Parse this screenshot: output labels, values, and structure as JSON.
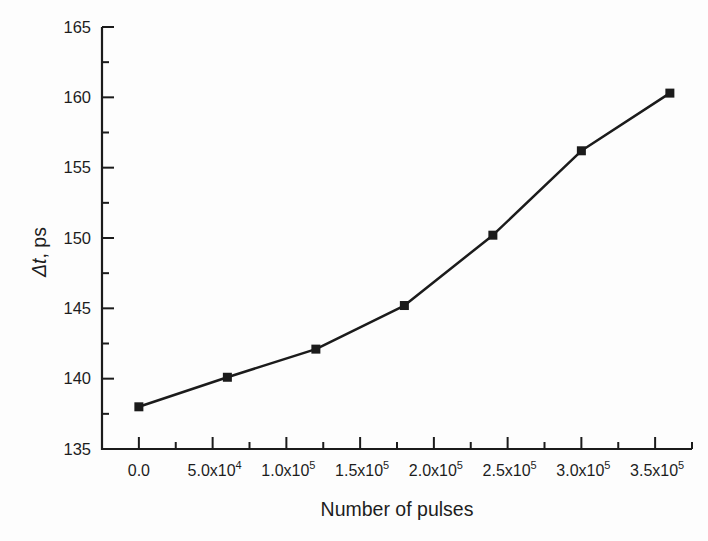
{
  "figure": {
    "background": "#fdfdfd",
    "ink_color": "#1b1b1b"
  },
  "chart_data": {
    "type": "line",
    "title": "",
    "xlabel": "Number of pulses",
    "ylabel": "Δt, ps",
    "ylabel_parts": {
      "italic": "Δt",
      "rest": ", ps"
    },
    "series": [
      {
        "name": "delta-t-vs-pulses",
        "marker": "filled-square",
        "x": [
          0,
          60000,
          120000,
          180000,
          240000,
          300000,
          360000
        ],
        "y": [
          138.0,
          140.1,
          142.1,
          145.2,
          150.2,
          156.2,
          160.3
        ]
      }
    ],
    "xlim": [
      -25000,
      375000
    ],
    "ylim": [
      135,
      165
    ],
    "x_major_ticks": [
      0,
      50000,
      100000,
      150000,
      200000,
      250000,
      300000,
      350000
    ],
    "x_tick_labels": [
      {
        "text": "0.0",
        "sup": ""
      },
      {
        "text": "5.0x10",
        "sup": "4"
      },
      {
        "text": "1.0x10",
        "sup": "5"
      },
      {
        "text": "1.5x10",
        "sup": "5"
      },
      {
        "text": "2.0x10",
        "sup": "5"
      },
      {
        "text": "2.5x10",
        "sup": "5"
      },
      {
        "text": "3.0x10",
        "sup": "5"
      },
      {
        "text": "3.5x10",
        "sup": "5"
      }
    ],
    "x_minor_ticks": [
      25000,
      75000,
      125000,
      175000,
      225000,
      275000,
      325000,
      375000
    ],
    "y_major_ticks": [
      135,
      140,
      145,
      150,
      155,
      160,
      165
    ],
    "y_tick_labels": [
      "135",
      "140",
      "145",
      "150",
      "155",
      "160",
      "165"
    ],
    "y_minor_ticks": [
      137.5,
      142.5,
      147.5,
      152.5,
      157.5,
      162.5
    ],
    "grid": false,
    "legend": false,
    "tick_direction": "in",
    "line_color": "#1b1b1b",
    "marker_color": "#1b1b1b"
  }
}
